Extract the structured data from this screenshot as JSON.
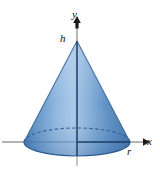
{
  "figure": {
    "labels": {
      "y_axis": "y",
      "x_axis": "x",
      "height": "h",
      "radius": "r"
    },
    "colors": {
      "cone_light": "#9dc1e4",
      "cone_mid": "#5b8ec4",
      "cone_dark": "#3f74ad",
      "cone_edge": "#2f5f96",
      "axis_line": "#9a9a9a",
      "axis_dark": "#1d3d66",
      "dashed_rim": "#2f5f96",
      "label_text": "#111111",
      "background": "#ffffff"
    },
    "geometry": {
      "apex_x": 77,
      "apex_y": 41,
      "base_center_x": 77,
      "base_center_y": 142,
      "base_radius_x": 53,
      "base_radius_y": 14,
      "x_axis_y": 142,
      "x_axis_start_x": 2,
      "x_axis_end_x": 146,
      "y_axis_x": 77,
      "y_axis_top_y": 20,
      "y_axis_bottom_y": 163
    },
    "icons": {
      "y_arrow": "arrow-up-icon",
      "x_arrow": "arrow-right-icon"
    }
  }
}
